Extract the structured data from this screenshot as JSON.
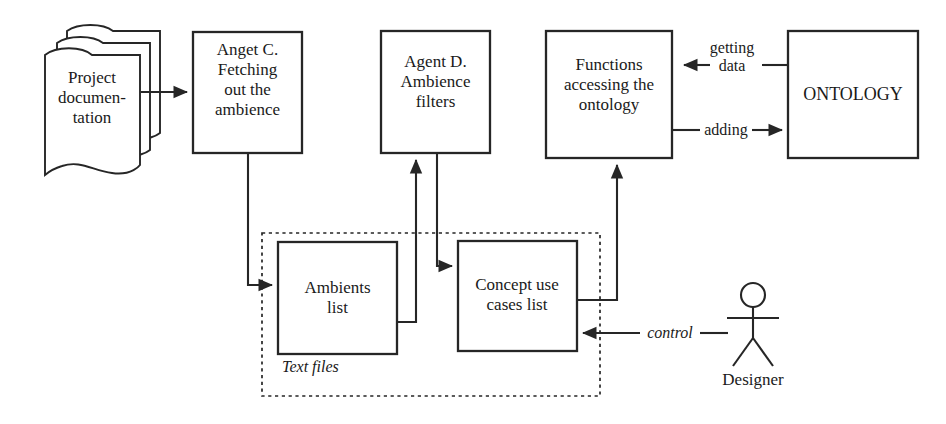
{
  "diagram": {
    "stroke_color": "#262626",
    "background_color": "#ffffff",
    "nodes": {
      "project_documentation": {
        "label": "Project\ndocumen-\ntation",
        "line1": "Project",
        "line2": "documen-",
        "line3": "tation",
        "shape": "document-stack"
      },
      "agent_c": {
        "label": "Anget C.\nFetching\nout the\nambience",
        "line1": "Anget C.",
        "line2": "Fetching",
        "line3": "out the",
        "line4": "ambience",
        "shape": "rectangle"
      },
      "agent_d": {
        "label": "Agent D.\nAmbience\nfilters",
        "line1": "Agent D.",
        "line2": "Ambience",
        "line3": "filters",
        "shape": "rectangle"
      },
      "functions": {
        "label": "Functions\naccessing the\nontology",
        "line1": "Functions",
        "line2": "accessing the",
        "line3": "ontology",
        "shape": "rectangle"
      },
      "ontology": {
        "label": "ONTOLOGY",
        "shape": "rectangle"
      },
      "ambients_list": {
        "label": "Ambients\nlist",
        "line1": "Ambients",
        "line2": "list",
        "shape": "rectangle"
      },
      "concept_use_cases_list": {
        "label": "Concept use\ncases list",
        "line1": "Concept use",
        "line2": "cases list",
        "shape": "rectangle"
      },
      "designer": {
        "label": "Designer",
        "shape": "stick-figure"
      }
    },
    "groups": {
      "text_files": {
        "label": "Text files",
        "border": "dashed"
      }
    },
    "edge_labels": {
      "getting_data_line1": "getting",
      "getting_data_line2": "data",
      "adding": "adding",
      "control": "control"
    }
  }
}
